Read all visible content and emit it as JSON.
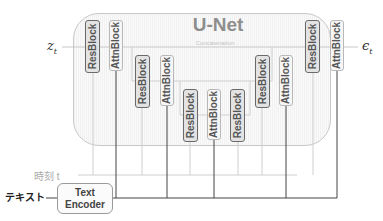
{
  "diagram": {
    "title": "U-Net",
    "concat_label": "Concatenation",
    "input_label": "z",
    "input_sub": "t",
    "output_label": "ϵ",
    "output_sub": "t",
    "time_label": "時刻 t",
    "text_label": "テキスト",
    "encoder": {
      "line1": "Text",
      "line2": "Encoder"
    },
    "blocks": [
      {
        "label": "ResBlock"
      },
      {
        "label": "AttnBlock"
      },
      {
        "label": "ResBlock"
      },
      {
        "label": "AttnBlock"
      },
      {
        "label": "ResBlock"
      },
      {
        "label": "AttnBlock"
      },
      {
        "label": "ResBlock"
      },
      {
        "label": "ResBlock"
      },
      {
        "label": "AttnBlock"
      },
      {
        "label": "ResBlock"
      },
      {
        "label": "AttnBlock"
      }
    ],
    "colors": {
      "res_border": "#6a6a6a",
      "res_fill": "#e3e3e3",
      "attn_fill": "#f6f6f6",
      "container": "#f4f4f4",
      "line_dark": "#333333",
      "line_light": "#c8c8c8"
    }
  }
}
